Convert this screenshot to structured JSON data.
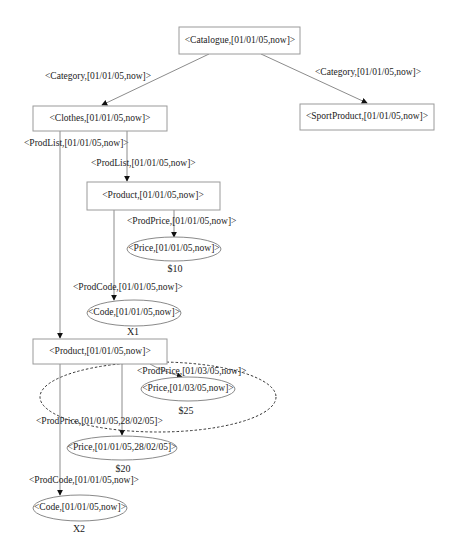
{
  "diagram": {
    "nodes": {
      "catalogue": {
        "label": "<Catalogue,[01/01/05,now]>",
        "shape": "rect"
      },
      "clothes": {
        "label": "<Clothes,[01/01/05,now]>",
        "shape": "rect"
      },
      "sport_product": {
        "label": "<SportProduct,[01/01/05,now]>",
        "shape": "rect"
      },
      "product1": {
        "label": "<Product,[01/01/05,now]>",
        "shape": "rect"
      },
      "price1": {
        "label": "<Price,[01/01/05,now]>",
        "shape": "ellipse",
        "value": "$10"
      },
      "code1": {
        "label": "<Code,[01/01/05,now]>",
        "shape": "ellipse",
        "value": "X1"
      },
      "product2": {
        "label": "<Product,[01/01/05,now]>",
        "shape": "rect"
      },
      "price2": {
        "label": "<Price,[01/03/05,now]>",
        "shape": "ellipse",
        "value": "$25"
      },
      "price3": {
        "label": "<Price,[01/01/05,28/02/05]>",
        "shape": "ellipse",
        "value": "$20"
      },
      "code2": {
        "label": "<Code,[01/01/05,now]>",
        "shape": "ellipse",
        "value": "X2"
      }
    },
    "edges": {
      "cat_clothes": "<Category,[01/01/05,now]>",
      "cat_sport": "<Category,[01/01/05,now]>",
      "clothes_product2": "<ProdList,[01/01/05,now]>",
      "clothes_product1": "<ProdList,[01/01/05,now]>",
      "product1_price1": "<ProdPrice,[01/01/05,now]>",
      "product1_code1": "<ProdCode,[01/01/05,now]>",
      "product2_price2": "<ProdPrice,[01/03/05,now]>",
      "product2_price3": "<ProdPrice,[01/01/05,28/02/05]>",
      "product2_code2": "<ProdCode,[01/01/05,now]>"
    },
    "colors": {
      "node_stroke": "#9a9a9a",
      "edge": "#8c8c8c",
      "dashed_group": "#333333",
      "text": "#222222"
    }
  }
}
